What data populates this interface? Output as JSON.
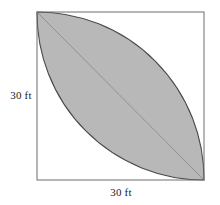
{
  "figure": {
    "kind": "geometry-diagram",
    "background_color": "#ffffff",
    "square": {
      "stroke_color": "#6e6e6e",
      "stroke_width": 1,
      "fill": "none",
      "left": 37,
      "top": 12,
      "right": 204,
      "bottom": 180,
      "side_px": 167
    },
    "lens": {
      "fill_color": "#b8b8b8",
      "stroke_color": "#4a4a4a",
      "stroke_width": 1.1,
      "arc_radius_px": 167,
      "arc1_center": "bottom-left-corner",
      "arc2_center": "top-right-corner",
      "vertex_start": "top-left-corner",
      "vertex_end": "bottom-right-corner"
    },
    "diagonal": {
      "stroke_color": "#8c8c8c",
      "stroke_width": 0.9,
      "from": "top-left-corner",
      "to": "bottom-right-corner"
    },
    "labels": {
      "left_side": "30 ft",
      "bottom_side": "30 ft"
    }
  }
}
